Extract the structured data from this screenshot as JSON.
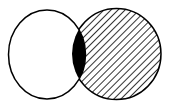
{
  "diagram": {
    "type": "venn",
    "sets": [
      {
        "name": "left-set",
        "fill": "none",
        "color": "#ffffff"
      },
      {
        "name": "right-set",
        "fill": "hatched",
        "color": "#000000"
      }
    ],
    "intersection": {
      "fill": "solid",
      "color": "#000000"
    },
    "colors": {
      "stroke": "#000000",
      "background": "#ffffff"
    }
  }
}
